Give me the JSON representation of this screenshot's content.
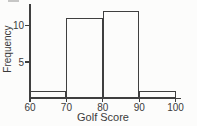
{
  "chart": {
    "xlabel": "Golf Score",
    "ylabel": "Frequency"
  },
  "chart_data": {
    "type": "bar",
    "subtype": "histogram",
    "title": "",
    "xlabel": "Golf Score",
    "ylabel": "Frequency",
    "bin_edges": [
      60,
      70,
      80,
      90,
      100
    ],
    "categories": [
      "60-70",
      "70-80",
      "80-90",
      "90-100"
    ],
    "values": [
      1,
      11,
      12,
      1
    ],
    "x_ticks": [
      60,
      70,
      80,
      90,
      100
    ],
    "y_ticks": [
      5,
      10
    ],
    "xlim": [
      60,
      100
    ],
    "ylim": [
      0,
      12
    ],
    "grid": false,
    "legend": "none",
    "bar_fill": "#fcfcfb",
    "line_color": "#3f3f3f",
    "text_color": "#3b3b3b",
    "background": "#fcfcfb"
  }
}
